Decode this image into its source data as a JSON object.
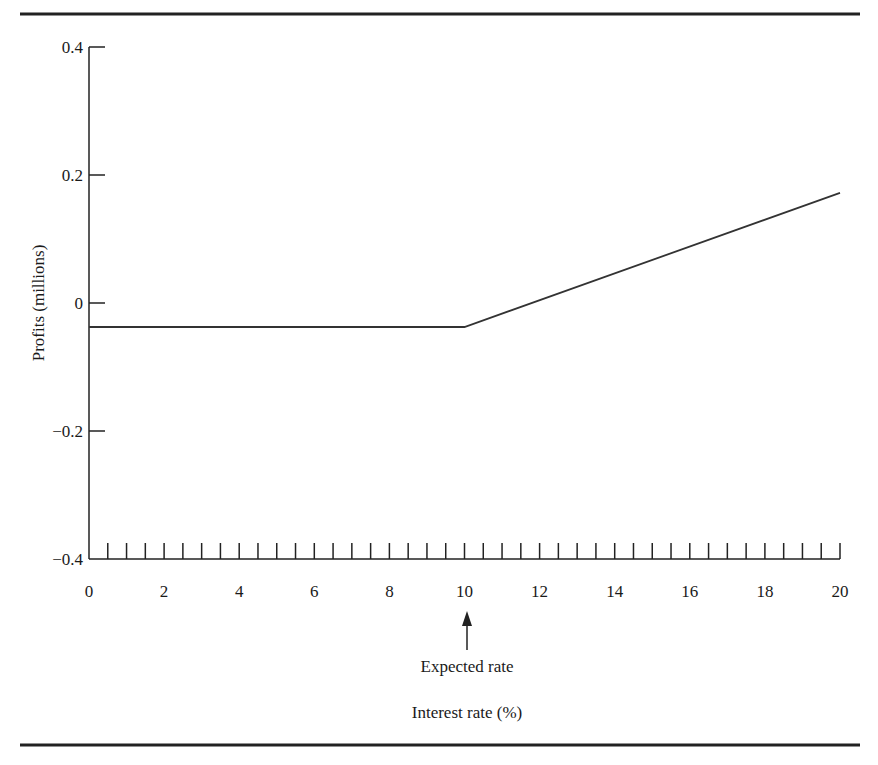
{
  "chart_data": {
    "type": "line",
    "title": "",
    "xlabel": "Interest rate (%)",
    "ylabel": "Profits (millions)",
    "xlim": [
      0,
      20
    ],
    "ylim": [
      -0.4,
      0.4
    ],
    "x_ticks": [
      0,
      2,
      4,
      6,
      8,
      10,
      12,
      14,
      16,
      18,
      20
    ],
    "x_tick_labels": [
      "0",
      "2",
      "4",
      "6",
      "8",
      "10",
      "12",
      "14",
      "16",
      "18",
      "20"
    ],
    "x_minor_tick_step": 0.5,
    "y_ticks": [
      0.4,
      0.2,
      0,
      -0.2,
      -0.4
    ],
    "y_tick_labels": [
      "0.4",
      "0.2",
      "0",
      "−0.2",
      "−0.4"
    ],
    "grid": false,
    "legend": null,
    "series": [
      {
        "name": "Profits",
        "x": [
          0,
          10,
          20
        ],
        "y": [
          -0.0375,
          -0.0375,
          0.172
        ]
      }
    ],
    "annotations": [
      {
        "text": "Expected rate",
        "x": 10,
        "type": "arrow-up-to-axis"
      }
    ]
  },
  "labels": {
    "xlabel": "Interest rate (%)",
    "ylabel": "Profits (millions)",
    "annotation": "Expected rate"
  }
}
